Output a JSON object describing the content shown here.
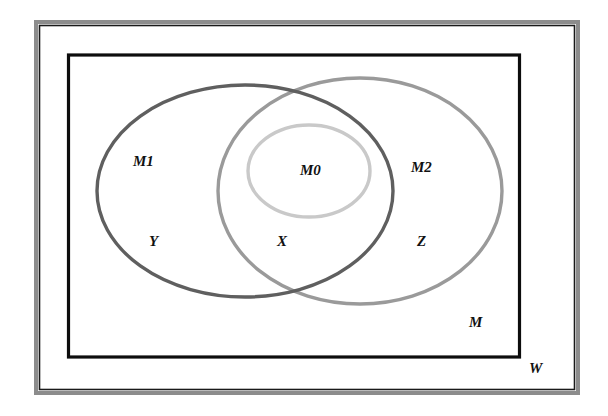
{
  "diagram": {
    "type": "venn",
    "regions": {
      "universe": {
        "label": "W"
      },
      "container": {
        "label": "M"
      }
    },
    "sets": [
      {
        "id": "M1",
        "label": "M1",
        "color": "#5f5f5f",
        "region_label": "Y"
      },
      {
        "id": "M2",
        "label": "M2",
        "color": "#9a9a9a",
        "region_label": "Z"
      },
      {
        "id": "M0",
        "label": "M0",
        "color": "#c9c9c9"
      }
    ],
    "intersection_label": "X",
    "labels": {
      "W": "W",
      "M": "M",
      "M1": "M1",
      "M2": "M2",
      "M0": "M0",
      "X": "X",
      "Y": "Y",
      "Z": "Z"
    },
    "colors": {
      "frame_outer": "#8c8c8c",
      "frame_line": "#1a1a1a",
      "container_border": "#0d0d0d",
      "M1": "#5f5f5f",
      "M2": "#9a9a9a",
      "M0": "#c9c9c9",
      "text": "#111111"
    }
  }
}
